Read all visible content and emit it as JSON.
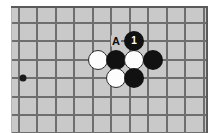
{
  "diagram": {
    "kind": "go-board-diagram",
    "game": "Go",
    "board_background_color": "#c9c9c9",
    "grid_line_color": "#6e6e6e",
    "frame_color": "#5a5a5a",
    "black_stone_color": "#111111",
    "white_stone_color": "#fdfdfd",
    "board": {
      "x": 11,
      "y": 6,
      "width": 197,
      "height": 127,
      "cell_size": 18.5,
      "vertical_lines_x": [
        7,
        25,
        44,
        62,
        81,
        99,
        118,
        136,
        155,
        173,
        192
      ],
      "horizontal_lines_y": [
        16,
        34,
        53,
        71,
        90,
        108,
        126
      ]
    },
    "star_points": [
      {
        "name": "hoshi",
        "x": 11,
        "y": 71
      }
    ],
    "stones": [
      {
        "name": "white-stone",
        "color": "white",
        "x": 86,
        "y": 53,
        "label": ""
      },
      {
        "name": "black-stone",
        "color": "black",
        "x": 104,
        "y": 53,
        "label": ""
      },
      {
        "name": "white-stone",
        "color": "white",
        "x": 122,
        "y": 53,
        "label": ""
      },
      {
        "name": "black-stone",
        "color": "black",
        "x": 141,
        "y": 53,
        "label": ""
      },
      {
        "name": "black-stone-move-1",
        "color": "black",
        "x": 122,
        "y": 34,
        "label": "1"
      },
      {
        "name": "white-stone",
        "color": "white",
        "x": 104,
        "y": 71,
        "label": ""
      },
      {
        "name": "black-stone",
        "color": "black",
        "x": 122,
        "y": 71,
        "label": ""
      }
    ],
    "point_labels": [
      {
        "name": "point-label-a",
        "text": "A",
        "x": 104,
        "y": 34
      }
    ],
    "move_numbers": [
      {
        "number": "1",
        "color": "black"
      }
    ]
  }
}
